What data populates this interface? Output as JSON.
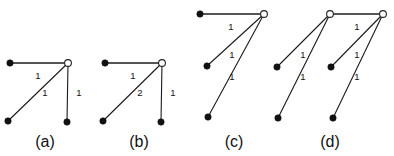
{
  "figure": {
    "background_color": "#ffffff",
    "edge_color": "#1a1a1a",
    "thick_edge_color": "#555555",
    "node_fill_color": "#111111",
    "node_open_color": "#ffffff",
    "width": 394,
    "height": 156
  },
  "panels": [
    {
      "id": "a",
      "caption": "(a)",
      "caption_x": 45,
      "caption_y": 147,
      "nodes": [
        {
          "name": "a-node-top-left",
          "x": 10,
          "y": 63,
          "type": "filled",
          "r": 3.2
        },
        {
          "name": "a-node-hub",
          "x": 68,
          "y": 63,
          "type": "open",
          "r": 3.4
        },
        {
          "name": "a-node-bottom-left",
          "x": 8,
          "y": 121,
          "type": "filled",
          "r": 3.2
        },
        {
          "name": "a-node-bottom-right",
          "x": 67,
          "y": 122,
          "type": "filled",
          "r": 3.2
        }
      ],
      "edges": [
        {
          "name": "a-edge-top",
          "x1": 10,
          "y1": 63,
          "x2": 68,
          "y2": 63,
          "weight": "1",
          "lx": 38,
          "ly": 76,
          "style": "thick"
        },
        {
          "name": "a-edge-diagonal",
          "x1": 8,
          "y1": 121,
          "x2": 68,
          "y2": 63,
          "weight": "1",
          "lx": 45,
          "ly": 93,
          "style": "thin"
        },
        {
          "name": "a-edge-right",
          "x1": 68,
          "y1": 63,
          "x2": 67,
          "y2": 122,
          "weight": "1",
          "lx": 79,
          "ly": 93,
          "style": "thin"
        }
      ]
    },
    {
      "id": "b",
      "caption": "(b)",
      "caption_x": 139,
      "caption_y": 147,
      "nodes": [
        {
          "name": "b-node-top-left",
          "x": 105,
          "y": 63,
          "type": "filled",
          "r": 3.2
        },
        {
          "name": "b-node-hub",
          "x": 162,
          "y": 63,
          "type": "open",
          "r": 3.4
        },
        {
          "name": "b-node-bottom-left",
          "x": 103,
          "y": 121,
          "type": "filled",
          "r": 3.2
        },
        {
          "name": "b-node-bottom-right",
          "x": 161,
          "y": 122,
          "type": "filled",
          "r": 3.2
        }
      ],
      "edges": [
        {
          "name": "b-edge-top",
          "x1": 105,
          "y1": 63,
          "x2": 162,
          "y2": 63,
          "weight": "1",
          "lx": 133,
          "ly": 76,
          "style": "thick"
        },
        {
          "name": "b-edge-diagonal",
          "x1": 103,
          "y1": 121,
          "x2": 162,
          "y2": 63,
          "weight": "2",
          "lx": 140,
          "ly": 93,
          "style": "thin"
        },
        {
          "name": "b-edge-right",
          "x1": 162,
          "y1": 63,
          "x2": 161,
          "y2": 122,
          "weight": "1",
          "lx": 173,
          "ly": 93,
          "style": "thin"
        }
      ]
    },
    {
      "id": "c",
      "caption": "(c)",
      "caption_x": 234,
      "caption_y": 147,
      "nodes": [
        {
          "name": "c-node-top-left",
          "x": 200,
          "y": 14,
          "type": "filled",
          "r": 3.2
        },
        {
          "name": "c-node-hub",
          "x": 264,
          "y": 14,
          "type": "open",
          "r": 3.4
        },
        {
          "name": "c-node-middle-left",
          "x": 207,
          "y": 66,
          "type": "filled",
          "r": 3.2
        },
        {
          "name": "c-node-bottom-left",
          "x": 208,
          "y": 117,
          "type": "filled",
          "r": 3.2
        }
      ],
      "edges": [
        {
          "name": "c-edge-top",
          "x1": 200,
          "y1": 14,
          "x2": 264,
          "y2": 14,
          "weight": "1",
          "lx": 231,
          "ly": 27,
          "style": "thick"
        },
        {
          "name": "c-edge-middle",
          "x1": 207,
          "y1": 66,
          "x2": 264,
          "y2": 14,
          "weight": "1",
          "lx": 232,
          "ly": 55,
          "style": "thin"
        },
        {
          "name": "c-edge-bottom",
          "x1": 208,
          "y1": 117,
          "x2": 264,
          "y2": 14,
          "weight": "1",
          "lx": 232,
          "ly": 77,
          "style": "thin"
        }
      ]
    },
    {
      "id": "d",
      "caption": "(d)",
      "caption_x": 330,
      "caption_y": 147,
      "nodes": [
        {
          "name": "d-node-hub-left",
          "x": 330,
          "y": 14,
          "type": "open",
          "r": 3.4
        },
        {
          "name": "d-node-hub-right",
          "x": 383,
          "y": 14,
          "type": "open",
          "r": 3.4
        },
        {
          "name": "d-node-leaf-1",
          "x": 277,
          "y": 67,
          "type": "filled",
          "r": 3.2
        },
        {
          "name": "d-node-leaf-2",
          "x": 278,
          "y": 118,
          "type": "filled",
          "r": 3.2
        },
        {
          "name": "d-node-leaf-3",
          "x": 331,
          "y": 67,
          "type": "filled",
          "r": 3.2
        },
        {
          "name": "d-node-leaf-4",
          "x": 333,
          "y": 118,
          "type": "filled",
          "r": 3.2
        }
      ],
      "edges": [
        {
          "name": "d-edge-hub-to-hub",
          "x1": 330,
          "y1": 14,
          "x2": 383,
          "y2": 14,
          "weight": "1",
          "lx": 357,
          "ly": 27,
          "style": "thick"
        },
        {
          "name": "d-edge-left-upper",
          "x1": 277,
          "y1": 67,
          "x2": 330,
          "y2": 14,
          "weight": "1",
          "lx": 303,
          "ly": 55,
          "style": "thin"
        },
        {
          "name": "d-edge-left-lower",
          "x1": 278,
          "y1": 118,
          "x2": 330,
          "y2": 14,
          "weight": "1",
          "lx": 303,
          "ly": 77,
          "style": "thin"
        },
        {
          "name": "d-edge-right-upper",
          "x1": 331,
          "y1": 67,
          "x2": 383,
          "y2": 14,
          "weight": "1",
          "lx": 357,
          "ly": 55,
          "style": "thin"
        },
        {
          "name": "d-edge-right-lower",
          "x1": 333,
          "y1": 118,
          "x2": 383,
          "y2": 14,
          "weight": "1",
          "lx": 357,
          "ly": 77,
          "style": "thin"
        }
      ]
    }
  ]
}
